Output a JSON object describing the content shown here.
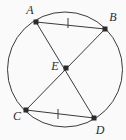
{
  "figure": {
    "type": "circle-geometry-diagram",
    "background_color": "#fafafa",
    "stroke_color": "#3a3a3a",
    "point_color": "#2b2b2b",
    "width": 126,
    "height": 140,
    "circle": {
      "label": "circle",
      "center_x": 65,
      "center_y": 69.5,
      "radius": 57.5,
      "stroke_width": 1
    },
    "points": [
      {
        "id": "A",
        "label": "A",
        "x": 36,
        "y": 22,
        "label_x": 30,
        "label_y": 10
      },
      {
        "id": "B",
        "label": "B",
        "x": 105,
        "y": 29,
        "label_x": 113,
        "label_y": 17
      },
      {
        "id": "C",
        "label": "C",
        "x": 26,
        "y": 110,
        "label_x": 17,
        "label_y": 116
      },
      {
        "id": "D",
        "label": "D",
        "x": 94,
        "y": 118,
        "label_x": 100,
        "label_y": 130
      },
      {
        "id": "E",
        "label": "E",
        "x": 66,
        "y": 68,
        "label_x": 55,
        "label_y": 66
      }
    ],
    "segments": [
      {
        "id": "AB",
        "label": "chord AB",
        "from": "A",
        "to": "B"
      },
      {
        "id": "CD",
        "label": "chord CD",
        "from": "C",
        "to": "D"
      },
      {
        "id": "AD",
        "label": "chord AD through E",
        "from": "A",
        "to": "D"
      },
      {
        "id": "BC",
        "label": "chord BC through E",
        "from": "B",
        "to": "C"
      }
    ],
    "tick_marks": [
      {
        "id": "tick-AB",
        "label": "congruence tick on AB",
        "on_segment": "AB",
        "x": 68,
        "y": 23,
        "count": 1
      },
      {
        "id": "tick-CD",
        "label": "congruence tick on CD",
        "on_segment": "CD",
        "x": 58,
        "y": 114,
        "count": 1
      }
    ]
  }
}
